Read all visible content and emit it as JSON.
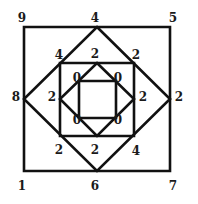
{
  "diagram": {
    "stroke_color": "#111111",
    "shapes": [
      {
        "name": "outer-square",
        "type": "square",
        "points": "24,27 170,27 170,171 24,171"
      },
      {
        "name": "outer-diamond",
        "type": "diamond",
        "points": "97,27 170,99 97,171 24,99"
      },
      {
        "name": "middle-square",
        "type": "square",
        "points": "60,63 134,63 134,136 60,136"
      },
      {
        "name": "inner-diamond",
        "type": "diamond",
        "points": "97,63 134,99 97,136 60,99"
      },
      {
        "name": "inner-square",
        "type": "square",
        "points": "79,81 116,81 116,118 79,118"
      }
    ],
    "labels": {
      "outer_top_left": {
        "text": "9",
        "x": 22,
        "y": 18
      },
      "outer_top_mid": {
        "text": "4",
        "x": 95,
        "y": 18
      },
      "outer_top_right": {
        "text": "5",
        "x": 173,
        "y": 18
      },
      "outer_left_mid": {
        "text": "8",
        "x": 16,
        "y": 97
      },
      "outer_right_mid": {
        "text": "2",
        "x": 179,
        "y": 97
      },
      "outer_bottom_left": {
        "text": "1",
        "x": 22,
        "y": 186
      },
      "outer_bottom_mid": {
        "text": "6",
        "x": 95,
        "y": 186
      },
      "outer_bottom_right": {
        "text": "7",
        "x": 173,
        "y": 186
      },
      "mid_top_left": {
        "text": "4",
        "x": 59,
        "y": 55
      },
      "mid_top_mid": {
        "text": "2",
        "x": 95,
        "y": 54
      },
      "mid_top_right": {
        "text": "2",
        "x": 136,
        "y": 55
      },
      "mid_left": {
        "text": "2",
        "x": 52,
        "y": 97
      },
      "mid_right": {
        "text": "2",
        "x": 143,
        "y": 97
      },
      "mid_bottom_left": {
        "text": "2",
        "x": 59,
        "y": 150
      },
      "mid_bottom_mid": {
        "text": "2",
        "x": 95,
        "y": 150
      },
      "mid_bottom_right": {
        "text": "4",
        "x": 136,
        "y": 151
      },
      "inner_top_left": {
        "text": "0",
        "x": 77,
        "y": 78
      },
      "inner_top_right": {
        "text": "0",
        "x": 118,
        "y": 78
      },
      "inner_bottom_left": {
        "text": "0",
        "x": 77,
        "y": 120
      },
      "inner_bottom_right": {
        "text": "0",
        "x": 118,
        "y": 120
      }
    }
  }
}
